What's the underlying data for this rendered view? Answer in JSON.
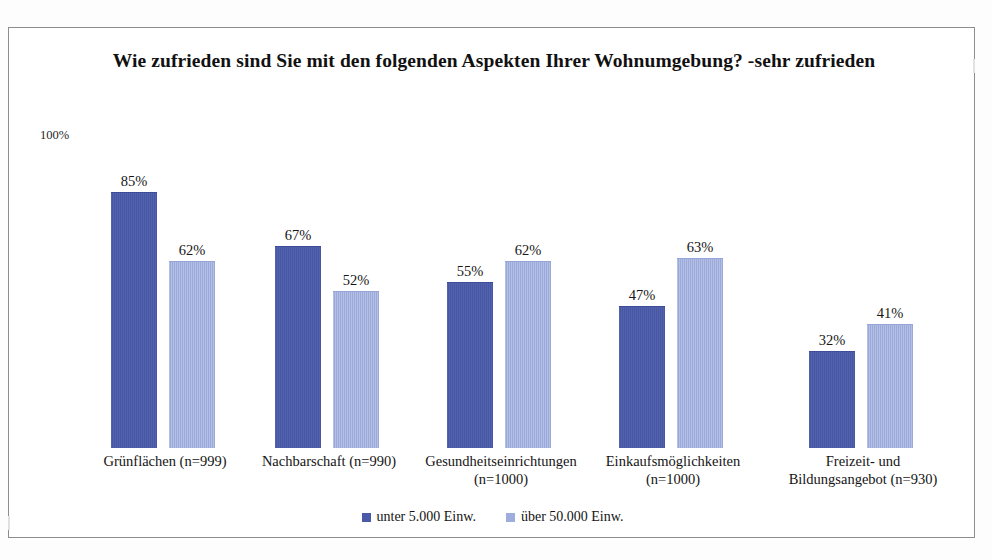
{
  "chart_data": {
    "type": "bar",
    "title": "Wie zufrieden sind Sie mit den folgenden Aspekten Ihrer Wohnumgebung? -sehr zufrieden",
    "xlabel": "",
    "ylabel": "",
    "ylim": [
      0,
      100
    ],
    "axis_max_label": "100%",
    "grid": false,
    "legend_position": "bottom-center",
    "value_suffix": "%",
    "categories": [
      "Grünflächen (n=999)",
      "Nachbarschaft (n=990)",
      "Gesundheitseinrichtungen (n=1000)",
      "Einkaufsmöglichkeiten (n=1000)",
      "Freizeit- und Bildungsangebot (n=930)"
    ],
    "category_lines": [
      [
        "Grünflächen (n=999)"
      ],
      [
        "Nachbarschaft (n=990)"
      ],
      [
        "Gesundheitseinrichtungen",
        "(n=1000)"
      ],
      [
        "Einkaufsmöglichkeiten",
        "(n=1000)"
      ],
      [
        "Freizeit- und",
        "Bildungsangebot (n=930)"
      ]
    ],
    "series": [
      {
        "name": "unter 5.000 Einw.",
        "color": "#4a5aa8",
        "values": [
          85,
          67,
          55,
          47,
          32
        ],
        "labels": [
          "85%",
          "67%",
          "55%",
          "47%",
          "32%"
        ]
      },
      {
        "name": "über 50.000 Einw.",
        "color": "#9fadde",
        "values": [
          62,
          52,
          62,
          63,
          41
        ],
        "labels": [
          "62%",
          "52%",
          "62%",
          "63%",
          "41%"
        ]
      }
    ]
  },
  "legend": {
    "entries": [
      {
        "label": "unter 5.000 Einw."
      },
      {
        "label": "über 50.000 Einw."
      }
    ]
  }
}
